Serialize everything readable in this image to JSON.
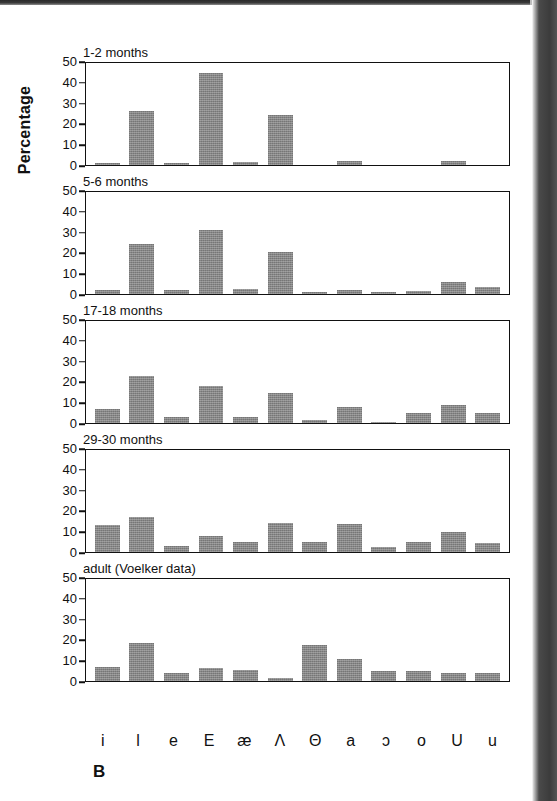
{
  "figure": {
    "panel_letter": "B",
    "y_axis_title": "Percentage"
  },
  "chart_data": {
    "type": "bar",
    "title": "",
    "xlabel": "",
    "ylabel": "Percentage",
    "ylim": [
      0,
      50
    ],
    "yticks": [
      50,
      40,
      30,
      20,
      10,
      0
    ],
    "grid": false,
    "legend": "none",
    "categories": [
      "i",
      "l",
      "e",
      "E",
      "æ",
      "Λ",
      "Θ",
      "a",
      "ɔ",
      "o",
      "U",
      "u"
    ],
    "panels": [
      {
        "title": "1-2 months",
        "values": [
          1,
          26.5,
          1,
          45.5,
          1.5,
          25,
          0,
          2,
          0,
          0,
          2,
          0
        ]
      },
      {
        "title": "5-6 months",
        "values": [
          2,
          25,
          2,
          31.5,
          2.5,
          21,
          1,
          2,
          1,
          1.5,
          6,
          3.5
        ]
      },
      {
        "title": "17-18 months",
        "values": [
          7,
          23.5,
          3,
          18.5,
          3,
          15,
          1.5,
          8,
          0.5,
          5,
          9,
          5
        ]
      },
      {
        "title": "29-30 months",
        "values": [
          13.5,
          17.5,
          3,
          8,
          5,
          14.5,
          5,
          14,
          2.5,
          5,
          10,
          4.5
        ]
      },
      {
        "title": "adult (Voelker data)",
        "values": [
          7,
          19,
          4,
          6.5,
          5.5,
          1.5,
          18,
          11,
          5,
          5,
          4,
          4
        ]
      }
    ]
  }
}
